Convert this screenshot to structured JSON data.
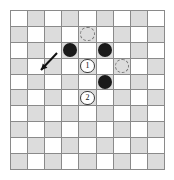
{
  "figure": {
    "kind": "checkerboard-diagram",
    "board": {
      "columns": 9,
      "rows": 10,
      "light_color": "#ffffff",
      "dark_color": "#dcdcdc",
      "line_color": "#8a8a8a",
      "origin_cell_shade": "light"
    },
    "stones": [
      {
        "label": "stone-a",
        "col": 3,
        "row": 2,
        "color": "#1a1a1a"
      },
      {
        "label": "stone-b",
        "col": 5,
        "row": 2,
        "color": "#1a1a1a"
      },
      {
        "label": "stone-c",
        "col": 5,
        "row": 4,
        "color": "#1a1a1a"
      }
    ],
    "markers": [
      {
        "label": "1",
        "col": 4,
        "row": 3
      },
      {
        "label": "2",
        "col": 4,
        "row": 5
      }
    ],
    "ghosts": [
      {
        "label": "ghost-top",
        "col": 4,
        "row": 1
      },
      {
        "label": "ghost-right",
        "col": 6,
        "row": 3
      }
    ],
    "arrow": {
      "label": "move-arrow",
      "from_x": 57,
      "from_y": 53,
      "to_x": 41,
      "to_y": 70,
      "color": "#111111"
    }
  }
}
